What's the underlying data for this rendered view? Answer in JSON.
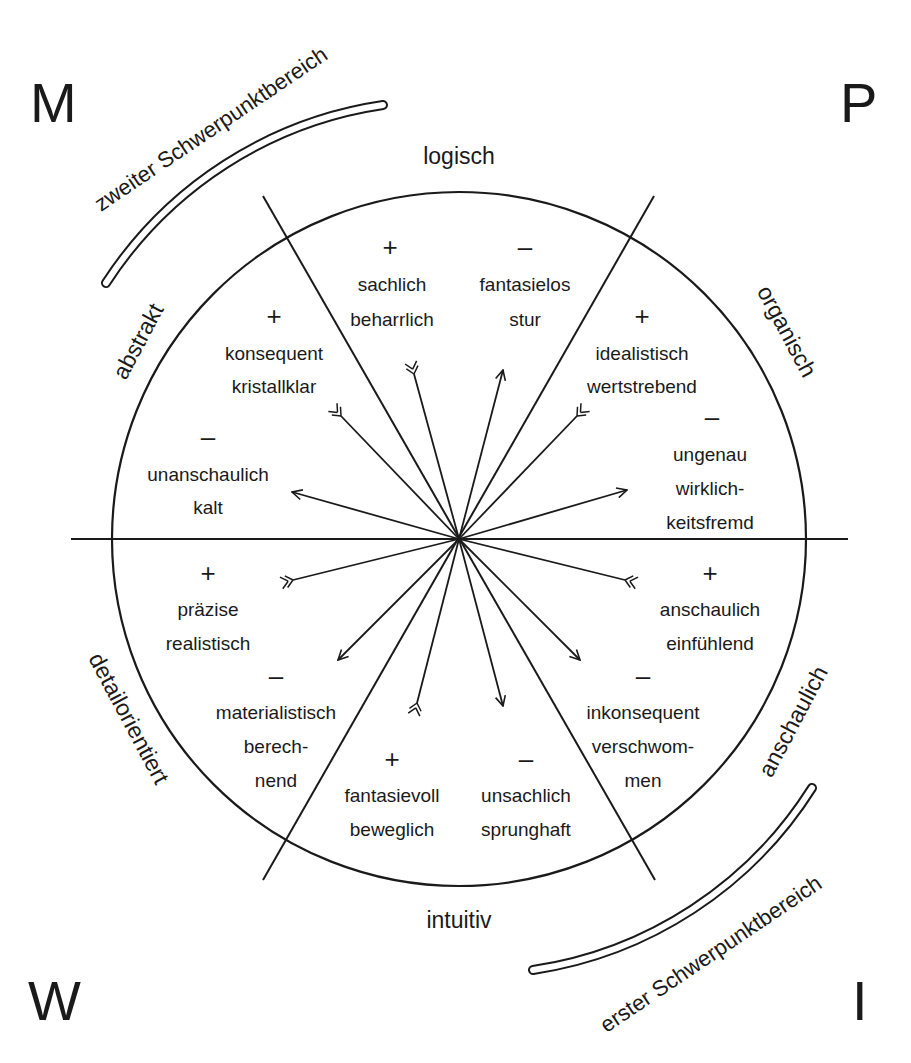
{
  "corners": {
    "top_left": "M",
    "top_right": "P",
    "bottom_left": "W",
    "bottom_right": "I"
  },
  "axes": {
    "top": "logisch",
    "bottom": "intuitiv",
    "upper_left": "abstrakt",
    "upper_right": "organisch",
    "lower_left": "detailorientiert",
    "lower_right": "anschaulich"
  },
  "focus_areas": {
    "second": "zweiter Schwerpunktbereich",
    "first": "erster Schwerpunktbereich"
  },
  "sectors": {
    "top_left_plus": {
      "sign": "+",
      "line1": "sachlich",
      "line2": "beharrlich"
    },
    "top_right_minus": {
      "sign": "–",
      "line1": "fantasielos",
      "line2": "stur"
    },
    "left_upper_plus": {
      "sign": "+",
      "line1": "konsequent",
      "line2": "kristallklar"
    },
    "left_upper_minus": {
      "sign": "–",
      "line1": "unanschaulich",
      "line2": "kalt"
    },
    "right_upper_plus": {
      "sign": "+",
      "line1": "idealistisch",
      "line2": "wertstrebend"
    },
    "right_upper_minus": {
      "sign": "–",
      "line1": "ungenau",
      "line2": "wirklich-",
      "line3": "keitsfremd"
    },
    "left_lower_plus": {
      "sign": "+",
      "line1": "präzise",
      "line2": "realistisch"
    },
    "left_lower_minus": {
      "sign": "–",
      "line1": "materialistisch",
      "line2": "berech-",
      "line3": "nend"
    },
    "right_lower_plus": {
      "sign": "+",
      "line1": "anschaulich",
      "line2": "einfühlend"
    },
    "right_lower_minus": {
      "sign": "–",
      "line1": "inkonsequent",
      "line2": "verschwom-",
      "line3": "men"
    },
    "bottom_left_plus": {
      "sign": "+",
      "line1": "fantasievoll",
      "line2": "beweglich"
    },
    "bottom_right_minus": {
      "sign": "–",
      "line1": "unsachlich",
      "line2": "sprunghaft"
    }
  },
  "colors": {
    "ink": "#1a1a1a",
    "background": "#ffffff"
  }
}
